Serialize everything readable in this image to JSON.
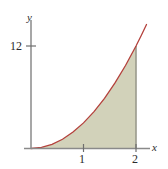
{
  "figure": {
    "title": "",
    "background_color": "#ffffff"
  },
  "axes": {
    "x_axis_label": "x",
    "y_axis_label": "y",
    "axis_color": "#8a8a8a",
    "x_ticks": [
      {
        "value": 1,
        "label": "1"
      },
      {
        "value": 2,
        "label": "2"
      }
    ],
    "y_ticks": [
      {
        "value": 12,
        "label": "12"
      }
    ]
  },
  "chart_data": {
    "type": "area",
    "title": "",
    "xlabel": "x",
    "ylabel": "y",
    "xlim": [
      0,
      2.3
    ],
    "ylim": [
      0,
      16
    ],
    "grid": false,
    "legend": null,
    "x_tick_labels": [
      "1",
      "2"
    ],
    "x_tick_values": [
      1,
      2
    ],
    "y_tick_labels": [
      "12"
    ],
    "y_tick_values": [
      12
    ],
    "series": [
      {
        "name": "curve",
        "curve_color": "#b4413c",
        "fill_color": "#d2d2ba",
        "fill_from_x": 0,
        "fill_to_x": 2,
        "x": [
          0,
          0.2,
          0.4,
          0.6,
          0.8,
          1.0,
          1.2,
          1.4,
          1.6,
          1.8,
          2.0,
          2.1,
          2.2
        ],
        "values": [
          0,
          0.12,
          0.48,
          1.08,
          1.92,
          3.0,
          4.32,
          5.88,
          7.68,
          9.72,
          12.0,
          13.23,
          14.52
        ]
      }
    ],
    "annotations": [
      {
        "kind": "vertical-boundary",
        "x": 2,
        "y_from": 0,
        "y_to": 12,
        "color": "#9a9a8c"
      }
    ]
  }
}
